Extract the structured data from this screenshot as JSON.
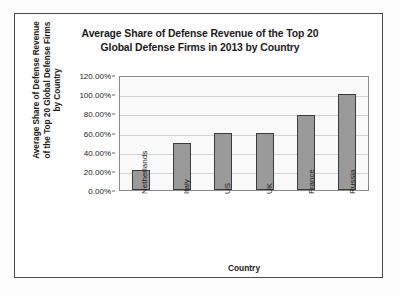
{
  "chart_data": {
    "type": "bar",
    "title": "Average Share of Defense Revenue of the Top 20 Global Defense Firms in 2013 by Country",
    "title_lines": [
      "Average Share of Defense Revenue of the Top 20",
      "Global Defense Firms in 2013 by Country"
    ],
    "xlabel": "Country",
    "ylabel": "Average Share of Defense Revenue of the Top 20 Global Defense Firms by Country",
    "ylabel_lines": [
      "Average Share of Defense Revenue",
      "of the Top 20 Global Defense Firms",
      "by Country"
    ],
    "categories": [
      "Netherlands",
      "Italy",
      "US",
      "UK",
      "France",
      "Russia"
    ],
    "values": [
      20.5,
      49.5,
      59.0,
      59.5,
      78.0,
      100.0
    ],
    "value_labels": [
      "20.50%",
      "49.50%",
      "59.00%",
      "59.50%",
      "78.00%",
      "100.00%"
    ],
    "ylim": [
      0,
      120
    ],
    "ytick_values": [
      120,
      100,
      80,
      60,
      40,
      20,
      0
    ],
    "ytick_labels": [
      "120.00%",
      "100.00%",
      "80.00%",
      "60.00%",
      "40.00%",
      "20.00%",
      "0.00%"
    ],
    "grid": true,
    "legend": false,
    "legend_position": "none",
    "series_color": "#9a9a9a",
    "bar_outline_color": "#3c3c3c",
    "plot_background": "#fafafa",
    "gridline_color": "#d2d2d2",
    "frame_color": "#4a4a4a"
  }
}
